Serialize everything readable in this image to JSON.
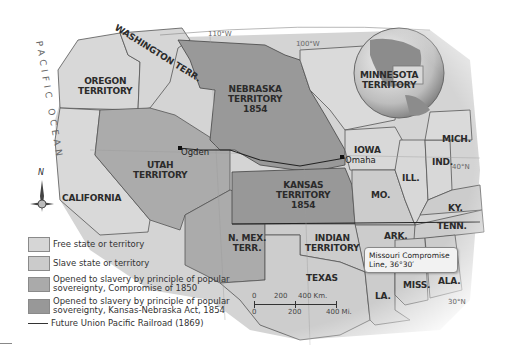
{
  "map": {
    "ocean_label": "PACIFIC OCEAN",
    "grid_labels": {
      "lon_110": "110°W",
      "lon_100": "100°W",
      "lat_40": "40°N",
      "lat_30": "30°N"
    },
    "compass": {
      "north": "N"
    },
    "regions": {
      "washington": "WASHINGTON TERR.",
      "oregon": [
        "OREGON",
        "TERRITORY"
      ],
      "nebraska": [
        "NEBRASKA",
        "TERRITORY",
        "1854"
      ],
      "minnesota": [
        "MINNESOTA",
        "TERRITORY"
      ],
      "utah": [
        "UTAH",
        "TERRITORY"
      ],
      "california": "CALIFORNIA",
      "kansas": [
        "KANSAS",
        "TERRITORY",
        "1854"
      ],
      "iowa": "IOWA",
      "michigan": "MICH.",
      "indiana": "IND.",
      "illinois": "ILL.",
      "missouri": "MO.",
      "kentucky": "KY.",
      "tennessee": "TENN.",
      "arkansas": "ARK.",
      "new_mexico": [
        "N. MEX.",
        "TERR."
      ],
      "indian": [
        "INDIAN",
        "TERRITORY"
      ],
      "texas": "TEXAS",
      "mississippi": "MISS.",
      "alabama": "ALA.",
      "louisiana": "LA."
    },
    "cities": {
      "ogden": "Ogden",
      "omaha": "Omaha"
    },
    "callout": {
      "line1": "Missouri Compromise",
      "line2": "Line, 36°30′"
    },
    "scale": {
      "km_0": "0",
      "km_200": "200",
      "km_400": "400 Km.",
      "mi_0": "0",
      "mi_200": "200",
      "mi_400": "400 Mi."
    },
    "colors": {
      "free": "#d6d6d6",
      "slave": "#cbcbcb",
      "compromise_1850": "#aaaaaa",
      "kansas_nebraska_1854": "#989898",
      "boundary": "#444444"
    }
  },
  "legend": {
    "items": [
      {
        "label": "Free state or territory"
      },
      {
        "label": "Slave state or territory"
      },
      {
        "label_line1": "Opened to slavery by principle of popular",
        "label_line2": "sovereignty, Compromise of 1850"
      },
      {
        "label_line1": "Opened to slavery by principle of popular",
        "label_line2": "sovereignty, Kansas-Nebraska Act, 1854"
      },
      {
        "label": "Future Union Pacific Railroad (1869)"
      }
    ]
  }
}
